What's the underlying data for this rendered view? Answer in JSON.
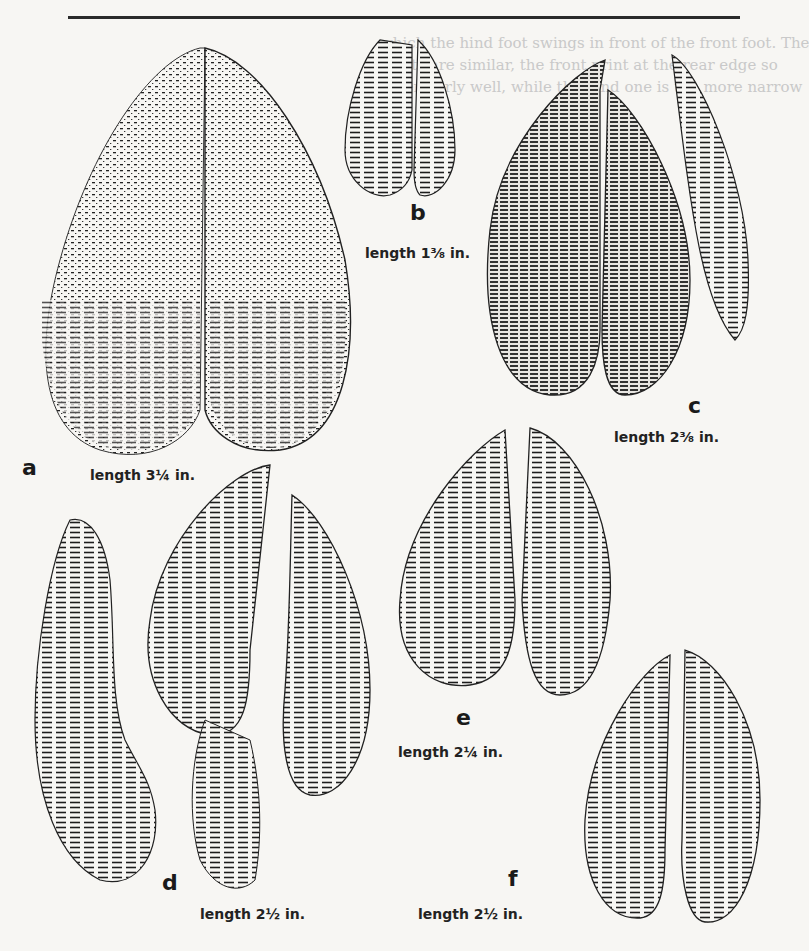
{
  "page": {
    "type": "book-illustration",
    "bleed_through_text": [
      "which the hind foot swings in front of the front foot. The",
      "prints are similar, the front print at the rear edge so",
      "other fairly well, while the hind one is the more narrow"
    ]
  },
  "figures": [
    {
      "id": "a",
      "letter": "a",
      "caption": "length 3¼ in."
    },
    {
      "id": "b",
      "letter": "b",
      "caption": "length 1⅜ in."
    },
    {
      "id": "c",
      "letter": "c",
      "caption": "length 2⅜ in."
    },
    {
      "id": "d",
      "letter": "d",
      "caption": "length 2½ in."
    },
    {
      "id": "e",
      "letter": "e",
      "caption": "length 2¼ in."
    },
    {
      "id": "f",
      "letter": "f",
      "caption": "length 2½ in."
    }
  ],
  "colors": {
    "paper": "#f7f6f3",
    "ink": "#1c1c1c",
    "bleed": "#c9c9c9"
  }
}
